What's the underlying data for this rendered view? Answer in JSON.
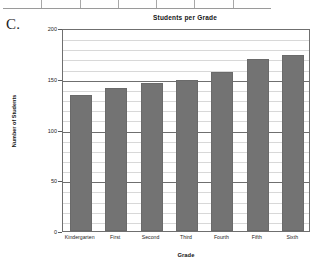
{
  "figure": {
    "label": "C."
  },
  "top_table": {
    "column_divider_count": 6
  },
  "chart_data": {
    "type": "bar",
    "title": "Students per Grade",
    "xlabel": "Grade",
    "ylabel": "Number of Students",
    "categories": [
      "Kindergarten",
      "First",
      "Second",
      "Third",
      "Fourth",
      "Fifth",
      "Sixth"
    ],
    "values": [
      134,
      141,
      146,
      149,
      157,
      169,
      173
    ],
    "ylim": [
      0,
      200
    ],
    "ytick_labels": [
      "0",
      "50",
      "100",
      "150",
      "200"
    ],
    "ytick_values": [
      0,
      50,
      100,
      150,
      200
    ],
    "minor_gridline_step": 10,
    "grid": true,
    "legend": "none",
    "bar_color": "#737373",
    "axis_color": "#6f6f6f",
    "grid_minor_color": "#d8d8d8"
  }
}
